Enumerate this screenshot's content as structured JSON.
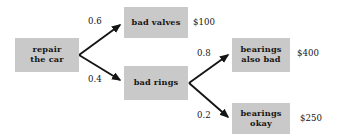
{
  "diagram": {
    "type": "probability-tree",
    "box_fill_color": "#c9c9c9",
    "text_color": "#151515",
    "background_color": "#ffffff",
    "nodes": [
      {
        "id": "root",
        "label": "repair\nthe car",
        "x": 15,
        "y": 38,
        "w": 64,
        "h": 34
      },
      {
        "id": "bad-valves",
        "label": "bad valves",
        "x": 124,
        "y": 7,
        "w": 64,
        "h": 31
      },
      {
        "id": "bad-rings",
        "label": "bad rings",
        "x": 124,
        "y": 66,
        "w": 64,
        "h": 34
      },
      {
        "id": "bearings-bad",
        "label": "bearings\nalso bad",
        "x": 232,
        "y": 38,
        "w": 58,
        "h": 34
      },
      {
        "id": "bearings-ok",
        "label": "bearings\nokay",
        "x": 232,
        "y": 103,
        "w": 58,
        "h": 31
      }
    ],
    "edges": [
      {
        "id": "root-to-bad-valves",
        "probability": "0.6",
        "label_x": 88,
        "label_y": 16
      },
      {
        "id": "root-to-bad-rings",
        "probability": "0.4",
        "label_x": 88,
        "label_y": 74
      },
      {
        "id": "rings-to-bearings-bad",
        "probability": "0.8",
        "label_x": 197,
        "label_y": 48
      },
      {
        "id": "rings-to-bearings-ok",
        "probability": "0.2",
        "label_x": 197,
        "label_y": 110
      }
    ],
    "payoffs": [
      {
        "id": "payoff-bad-valves",
        "amount": "$100",
        "x": 193,
        "y": 17
      },
      {
        "id": "payoff-bearings-bad",
        "amount": "$400",
        "x": 297,
        "y": 48
      },
      {
        "id": "payoff-bearings-ok",
        "amount": "$250",
        "x": 300,
        "y": 113
      }
    ]
  }
}
